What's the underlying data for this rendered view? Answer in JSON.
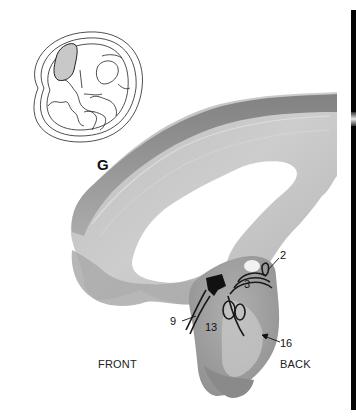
{
  "figure": {
    "panel_letter": "G",
    "orientation": {
      "left": "FRONT",
      "right": "BACK"
    },
    "labels": [
      {
        "id": "2",
        "text": "2"
      },
      {
        "id": "3",
        "text": "3"
      },
      {
        "id": "9",
        "text": "9"
      },
      {
        "id": "13",
        "text": "13"
      },
      {
        "id": "16",
        "text": "16"
      }
    ],
    "colors": {
      "tissue_dark": "#6e6e6e",
      "tissue_mid": "#a9a9a9",
      "tissue_light": "#cfcfcf",
      "outline": "#222222",
      "highlight": "#cccccc"
    }
  }
}
